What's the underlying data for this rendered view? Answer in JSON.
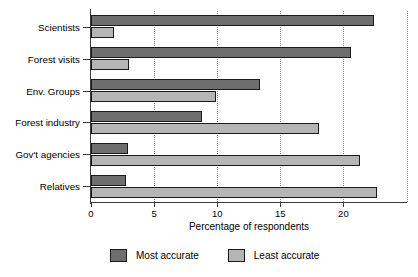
{
  "chart_data": {
    "type": "bar",
    "orientation": "horizontal",
    "title": "",
    "xlabel": "Percentage of respondents",
    "ylabel": "",
    "xlim": [
      0,
      25
    ],
    "xticks": [
      0,
      5,
      10,
      15,
      20
    ],
    "xtick_labels": [
      "0",
      "5",
      "10",
      "15",
      "20"
    ],
    "gridlines": [
      5,
      10,
      15,
      20,
      25
    ],
    "grid": true,
    "legend_position": "bottom",
    "categories": [
      "Scientists",
      "Forest visits",
      "Env. Groups",
      "Forest industry",
      "Gov't agencies",
      "Relatives"
    ],
    "series": [
      {
        "name": "Most accurate",
        "color": "#6e6e6e",
        "values": [
          22.4,
          20.6,
          13.4,
          8.8,
          2.9,
          2.8
        ]
      },
      {
        "name": "Least accurate",
        "color": "#b5b5b5",
        "values": [
          1.8,
          3.0,
          9.9,
          18.1,
          21.3,
          22.7
        ]
      }
    ]
  },
  "legend": {
    "items": [
      {
        "label": "Most accurate",
        "swatch": "most"
      },
      {
        "label": "Least accurate",
        "swatch": "least"
      }
    ]
  },
  "axis": {
    "x_title": "Percentage of respondents"
  }
}
